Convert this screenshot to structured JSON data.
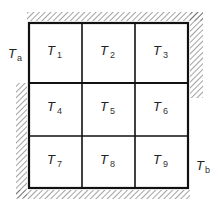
{
  "diagram": {
    "cells": [
      {
        "name": "T",
        "sub": "1"
      },
      {
        "name": "T",
        "sub": "2"
      },
      {
        "name": "T",
        "sub": "3"
      },
      {
        "name": "T",
        "sub": "4"
      },
      {
        "name": "T",
        "sub": "5"
      },
      {
        "name": "T",
        "sub": "6"
      },
      {
        "name": "T",
        "sub": "7"
      },
      {
        "name": "T",
        "sub": "8"
      },
      {
        "name": "T",
        "sub": "9"
      }
    ],
    "boundary_labels": {
      "left_top": {
        "name": "T",
        "sub": "a"
      },
      "right_bottom": {
        "name": "T",
        "sub": "b"
      }
    },
    "insulated_edges": [
      "top",
      "right-upper",
      "left-lower",
      "bottom"
    ],
    "colors": {
      "line": "#111111",
      "hatch": "#555555"
    }
  }
}
